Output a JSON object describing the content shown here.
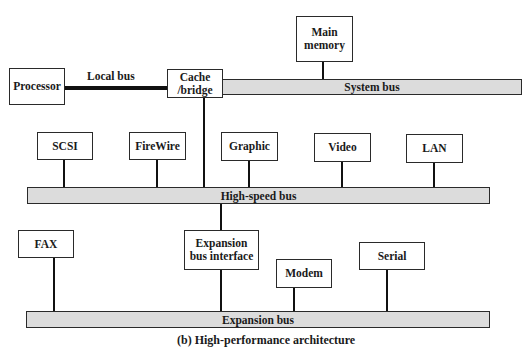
{
  "diagram": {
    "caption": "(b) High-performance architecture",
    "buses": {
      "local_bus": "Local bus",
      "system_bus": "System bus",
      "high_speed_bus": "High-speed bus",
      "expansion_bus": "Expansion bus"
    },
    "components": {
      "processor": "Processor",
      "cache_bridge": "Cache\n/bridge",
      "main_memory": "Main\nmemory",
      "scsi": "SCSI",
      "firewire": "FireWire",
      "graphic": "Graphic",
      "video": "Video",
      "lan": "LAN",
      "fax": "FAX",
      "expansion_bus_interface": "Expansion\nbus interface",
      "modem": "Modem",
      "serial": "Serial"
    },
    "colors": {
      "bus_fill": "#dcdcdc",
      "box_border": "#2a2a2a",
      "connector": "#111111",
      "background": "#ffffff"
    }
  }
}
